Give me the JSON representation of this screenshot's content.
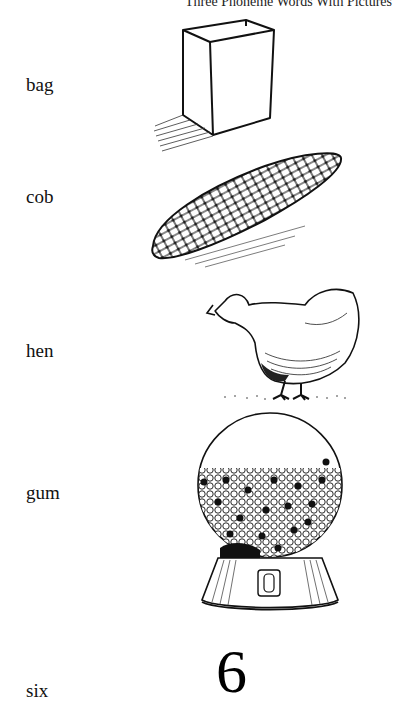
{
  "header": {
    "title": "Three Phoneme Words With Pictures"
  },
  "items": [
    {
      "word": "bag",
      "picture": "paper-bag-illustration"
    },
    {
      "word": "cob",
      "picture": "corn-cob-illustration"
    },
    {
      "word": "hen",
      "picture": "hen-illustration"
    },
    {
      "word": "gum",
      "picture": "gumball-machine-illustration"
    },
    {
      "word": "six",
      "picture": "numeral",
      "numeral": "6"
    }
  ]
}
